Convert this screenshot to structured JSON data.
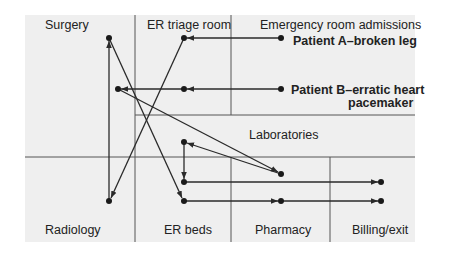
{
  "diagram": {
    "type": "hospital-patient-flow",
    "colors": {
      "background": "#efefef",
      "lines": "#2a2a2a",
      "grid": "#555555",
      "text": "#222222"
    },
    "zones": [
      {
        "id": "surgery",
        "label": "Surgery"
      },
      {
        "id": "er_triage",
        "label": "ER triage room"
      },
      {
        "id": "er_admissions",
        "label": "Emergency room admissions"
      },
      {
        "id": "laboratories",
        "label": "Laboratories"
      },
      {
        "id": "radiology",
        "label": "Radiology"
      },
      {
        "id": "er_beds",
        "label": "ER beds"
      },
      {
        "id": "pharmacy",
        "label": "Pharmacy"
      },
      {
        "id": "billing",
        "label": "Billing/exit"
      }
    ],
    "patients": [
      {
        "id": "A",
        "label": "Patient A–broken leg"
      },
      {
        "id": "B",
        "label_line1": "Patient B–erratic heart",
        "label_line2": "pacemaker"
      }
    ],
    "flows": {
      "patient_A": [
        "Emergency room admissions",
        "ER triage room",
        "Radiology",
        "Surgery",
        "ER beds",
        "Pharmacy",
        "Billing/exit"
      ],
      "patient_B": [
        "Emergency room admissions",
        "ER triage room",
        "Surgery",
        "Laboratories",
        "ER beds",
        "Laboratories",
        "ER beds",
        "Billing/exit"
      ]
    }
  }
}
